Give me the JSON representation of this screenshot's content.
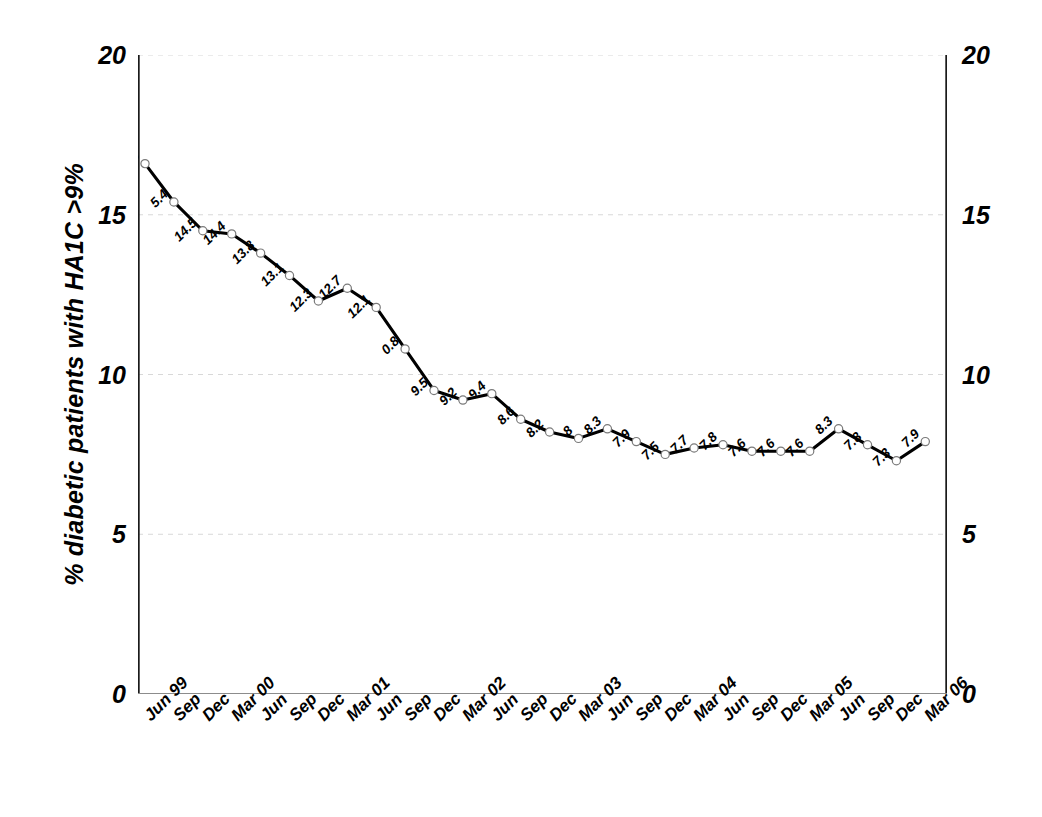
{
  "chart_data": {
    "type": "line",
    "title": "",
    "xlabel": "",
    "ylabel": "% diabetic patients with HA1C >9%",
    "ylim": [
      0,
      20
    ],
    "yticks": [
      0,
      5,
      10,
      15,
      20
    ],
    "ytick_labels": [
      "0",
      "5",
      "10",
      "15",
      "20"
    ],
    "right_axis": true,
    "right_ytick_labels": [
      "0",
      "5",
      "10",
      "15",
      "20"
    ],
    "grid": true,
    "grid_style": "dashed-light-gray",
    "legend": "none",
    "marker": "open-circle",
    "line_color": "#000000",
    "data_labels": true,
    "data_label_rotation": -45,
    "categories": [
      "Jun 99",
      "Sep",
      "Dec",
      "Mar 00",
      "Jun",
      "Sep",
      "Dec",
      "Mar 01",
      "Jun",
      "Sep",
      "Dec",
      "Mar 02",
      "Jun",
      "Sep",
      "Dec",
      "Mar 03",
      "Jun",
      "Sep",
      "Dec",
      "Mar 04",
      "Jun",
      "Sep",
      "Dec",
      "Mar 05",
      "Jun",
      "Sep",
      "Dec",
      "Mar 06"
    ],
    "values": [
      16.6,
      15.4,
      14.5,
      14.4,
      13.8,
      13.1,
      12.3,
      12.7,
      12.1,
      10.8,
      9.5,
      9.2,
      9.4,
      8.6,
      8.2,
      8,
      8.3,
      7.9,
      7.5,
      7.7,
      7.8,
      7.6,
      7.6,
      7.6,
      8.3,
      7.8,
      7.3,
      7.9
    ],
    "value_labels": [
      "16.6",
      "5.4",
      "14.5",
      "14.4",
      "13.8",
      "13.1",
      "12.3",
      "12.7",
      "12.1",
      "0.8",
      "9.5",
      "9.2",
      "9.4",
      "8.6",
      "8.2",
      "8",
      "8.3",
      "7.9",
      "7.5",
      "7.7",
      "7.8",
      "7.6",
      "7.6",
      "7.6",
      "8.3",
      "7.8",
      "7.3",
      "7.9"
    ]
  },
  "colors": {
    "line": "#000000",
    "marker_stroke": "#7a7a7a",
    "marker_fill": "#ffffff",
    "axis": "#1a1a1a",
    "grid": "#d8d8d8",
    "text": "#000000"
  }
}
